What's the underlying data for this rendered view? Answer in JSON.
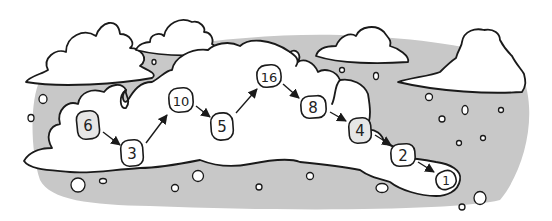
{
  "diagram": {
    "colors": {
      "sky_band": "#c8c8c8",
      "cloud_fill": "#ffffff",
      "outline": "#1a1a1a",
      "start_tile": "#e6e6e6",
      "tile": "#ffffff"
    },
    "nodes": [
      {
        "id": "n6",
        "label": "6",
        "x": 88,
        "y": 125,
        "start": true
      },
      {
        "id": "n3",
        "label": "3",
        "x": 132,
        "y": 153
      },
      {
        "id": "n10",
        "label": "10",
        "x": 181,
        "y": 100
      },
      {
        "id": "n5",
        "label": "5",
        "x": 222,
        "y": 126
      },
      {
        "id": "n16",
        "label": "16",
        "x": 269,
        "y": 76
      },
      {
        "id": "n8",
        "label": "8",
        "x": 313,
        "y": 107
      },
      {
        "id": "n4",
        "label": "4",
        "x": 360,
        "y": 130
      },
      {
        "id": "n2",
        "label": "2",
        "x": 403,
        "y": 155
      },
      {
        "id": "n1",
        "label": "1",
        "x": 446,
        "y": 180
      }
    ],
    "edges": [
      {
        "from": "6",
        "to": "3"
      },
      {
        "from": "3",
        "to": "10"
      },
      {
        "from": "10",
        "to": "5"
      },
      {
        "from": "5",
        "to": "16"
      },
      {
        "from": "16",
        "to": "8"
      },
      {
        "from": "8",
        "to": "4"
      },
      {
        "from": "4",
        "to": "2"
      },
      {
        "from": "2",
        "to": "1"
      }
    ]
  }
}
